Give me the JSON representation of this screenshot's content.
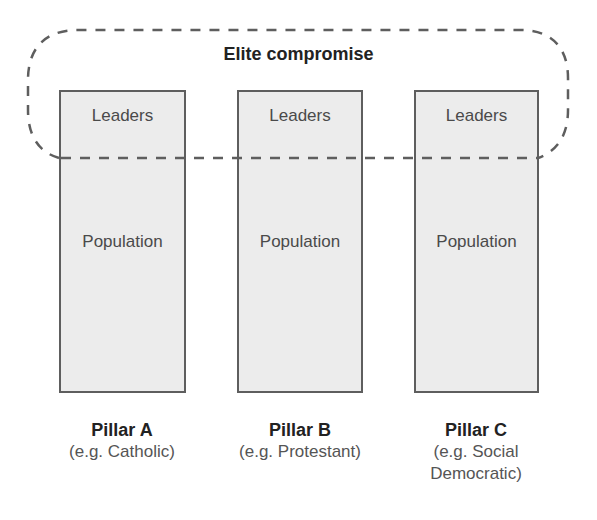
{
  "diagram": {
    "type": "consociationalism-pillarization",
    "elite_group_label": "Elite compromise",
    "pillars": [
      {
        "upper_label": "Leaders",
        "lower_label": "Population",
        "name": "Pillar A",
        "example": "(e.g. Catholic)"
      },
      {
        "upper_label": "Leaders",
        "lower_label": "Population",
        "name": "Pillar B",
        "example": "(e.g. Protestant)"
      },
      {
        "upper_label": "Leaders",
        "lower_label": "Population",
        "name": "Pillar C",
        "example_line1": "(e.g. Social",
        "example_line2": "Democratic)"
      }
    ],
    "colors": {
      "pillar_fill": "#ececec",
      "pillar_border": "#5e5e5e",
      "dashed_line": "#5e5e5e",
      "title_text": "#222222"
    }
  }
}
